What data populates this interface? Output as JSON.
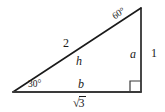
{
  "figure": {
    "type": "right-triangle-30-60-90",
    "background_color": "#ffffff",
    "line_color": "#1a1a1a",
    "text_color": "#1a1a1a"
  },
  "vertices": {
    "bottom_left": {
      "x": 13,
      "y": 92
    },
    "bottom_right": {
      "x": 141,
      "y": 92
    },
    "top_right": {
      "x": 141,
      "y": 8
    }
  },
  "labels": {
    "angle_top": "60°",
    "angle_left": "30°",
    "hypotenuse_outer": "2",
    "hypotenuse_inner": "h",
    "vertical_inner": "a",
    "vertical_outer": "1",
    "base_inner": "b",
    "base_outer_radical_sign": "√",
    "base_outer_radicand": "3"
  },
  "markers": {
    "right_angle": "right-angle-square"
  }
}
